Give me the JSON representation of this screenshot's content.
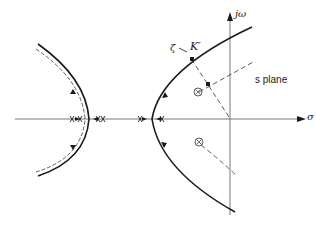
{
  "diagram": {
    "labels": {
      "imag_axis": "jω",
      "real_axis": "σ",
      "plane": "s plane",
      "zeta": "ζ",
      "zeta_arrow": "→",
      "gain_point": "K′"
    },
    "elements": {
      "loci_branches": 4,
      "zeros": 2,
      "closed_loop_pole_marker": "K′",
      "dashed_lines": [
        "damping ratio line ζ",
        "closed-loop pole asymptote",
        "zero-to-pole path"
      ]
    },
    "colors": {
      "stroke": "#1a1a1a",
      "background": "#ffffff"
    }
  }
}
